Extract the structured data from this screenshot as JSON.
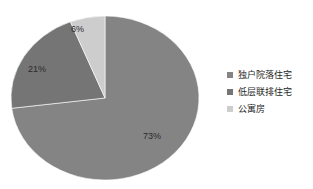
{
  "chart_data": {
    "type": "pie",
    "title": "",
    "subtitle": "",
    "xlabel": "",
    "ylabel": "",
    "grid": false,
    "legend_position": "right",
    "start_angle_deg": 0,
    "direction": "clockwise",
    "categories": [
      "独户院落住宅",
      "低层联排住宅",
      "公寓房"
    ],
    "values": [
      73,
      21,
      6
    ],
    "value_unit": "%",
    "data_labels": [
      "73%",
      "21%",
      "6%"
    ],
    "colors": [
      "#848484",
      "#757575",
      "#cdcdcd"
    ],
    "slices": [
      {
        "label": "独户院落住宅",
        "value": 73,
        "data_label": "73%",
        "color": "#848484"
      },
      {
        "label": "低层联排住宅",
        "value": 21,
        "data_label": "21%",
        "color": "#757575"
      },
      {
        "label": "公寓房",
        "value": 6,
        "data_label": "6%",
        "color": "#cdcdcd"
      }
    ]
  },
  "legend": {
    "items": [
      {
        "label": "独户院落住宅",
        "color": "#848484",
        "marker": "square-marker-icon"
      },
      {
        "label": "低层联排住宅",
        "color": "#757575",
        "marker": "square-marker-icon"
      },
      {
        "label": "公寓房",
        "color": "#cdcdcd",
        "marker": "square-marker-icon"
      }
    ]
  },
  "labels": {
    "slice_1": "73%",
    "slice_2": "21%",
    "slice_3": "6%"
  },
  "canvas": {
    "background": "#ffffff"
  }
}
